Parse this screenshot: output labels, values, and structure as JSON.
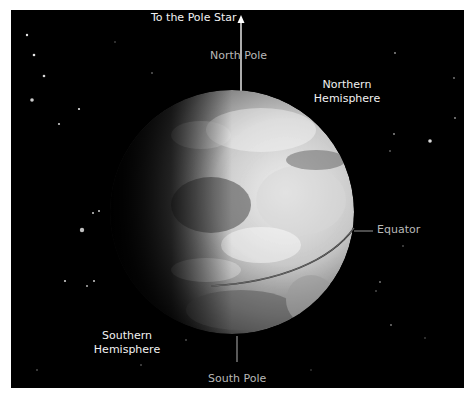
{
  "labels": {
    "pole_star": "To the Pole Star",
    "north_pole": "North Pole",
    "northern_hemisphere_line1": "Northern",
    "northern_hemisphere_line2": "Hemisphere",
    "equator": "Equator",
    "southern_hemisphere_line1": "Southern",
    "southern_hemisphere_line2": "Hemisphere",
    "south_pole": "South Pole"
  },
  "icons": {
    "pole_star_arrow": "arrow-up-icon"
  },
  "colors": {
    "background": "#000000",
    "border": "#ffffff",
    "label_text": "#f2f2f2",
    "dim_label_text": "#b8b8b8",
    "earth_light": "#f4f4f4",
    "earth_mid": "#8a8a8a",
    "earth_dark": "#000000"
  }
}
